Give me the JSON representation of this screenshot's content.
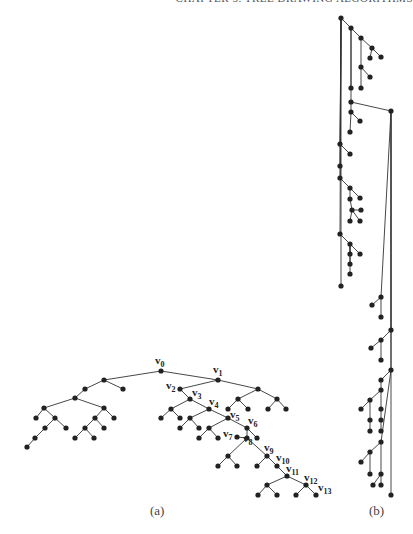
{
  "header": {
    "running_title": "CHAPTER 5.  TREE DRAWING ALGORITHMS"
  },
  "figure": {
    "captions": {
      "a": "(a)",
      "b": "(b)"
    },
    "style": {
      "edge_color": "#333333",
      "node_color": "#222222",
      "node_radius": 2.6
    },
    "tree_a": {
      "nodes": [
        {
          "id": "v0",
          "x": 161,
          "y": 371,
          "label": "v",
          "sub": "0",
          "lx": 155,
          "ly": 364
        },
        {
          "id": "v1",
          "x": 218,
          "y": 380,
          "label": "v",
          "sub": "1",
          "lx": 213,
          "ly": 373
        },
        {
          "id": "L1",
          "x": 104,
          "y": 380
        },
        {
          "id": "L2",
          "x": 123,
          "y": 389
        },
        {
          "id": "L3",
          "x": 85,
          "y": 389
        },
        {
          "id": "L4",
          "x": 75,
          "y": 398
        },
        {
          "id": "L5",
          "x": 44,
          "y": 408
        },
        {
          "id": "L6",
          "x": 36,
          "y": 418
        },
        {
          "id": "L7",
          "x": 55,
          "y": 418
        },
        {
          "id": "L8",
          "x": 45,
          "y": 428
        },
        {
          "id": "L9",
          "x": 66,
          "y": 428
        },
        {
          "id": "L10",
          "x": 35,
          "y": 438
        },
        {
          "id": "L11",
          "x": 27,
          "y": 447
        },
        {
          "id": "L12",
          "x": 104,
          "y": 408
        },
        {
          "id": "L13",
          "x": 114,
          "y": 418
        },
        {
          "id": "L14",
          "x": 95,
          "y": 418
        },
        {
          "id": "L15",
          "x": 85,
          "y": 428
        },
        {
          "id": "L16",
          "x": 104,
          "y": 428
        },
        {
          "id": "L17",
          "x": 75,
          "y": 438
        },
        {
          "id": "L18",
          "x": 94,
          "y": 438
        },
        {
          "id": "v2",
          "x": 180,
          "y": 389,
          "label": "v",
          "sub": "2",
          "lx": 166,
          "ly": 389
        },
        {
          "id": "R1",
          "x": 258,
          "y": 389
        },
        {
          "id": "R2",
          "x": 238,
          "y": 399
        },
        {
          "id": "R3",
          "x": 277,
          "y": 399
        },
        {
          "id": "R4",
          "x": 228,
          "y": 409
        },
        {
          "id": "R5",
          "x": 248,
          "y": 409
        },
        {
          "id": "R6",
          "x": 268,
          "y": 409
        },
        {
          "id": "R7",
          "x": 286,
          "y": 409
        },
        {
          "id": "v3",
          "x": 190,
          "y": 399,
          "label": "v",
          "sub": "3",
          "lx": 192,
          "ly": 396
        },
        {
          "id": "A1",
          "x": 171,
          "y": 409
        },
        {
          "id": "A2",
          "x": 161,
          "y": 418
        },
        {
          "id": "A3",
          "x": 180,
          "y": 418
        },
        {
          "id": "v4",
          "x": 209,
          "y": 409,
          "label": "v",
          "sub": "4",
          "lx": 209,
          "ly": 405
        },
        {
          "id": "B1",
          "x": 190,
          "y": 418
        },
        {
          "id": "B2",
          "x": 180,
          "y": 428
        },
        {
          "id": "B3",
          "x": 199,
          "y": 428
        },
        {
          "id": "v5",
          "x": 228,
          "y": 418,
          "label": "v",
          "sub": "5",
          "lx": 230,
          "ly": 418
        },
        {
          "id": "C1",
          "x": 209,
          "y": 428
        },
        {
          "id": "C2",
          "x": 199,
          "y": 438
        },
        {
          "id": "C3",
          "x": 218,
          "y": 438
        },
        {
          "id": "v6",
          "x": 247,
          "y": 428,
          "label": "v",
          "sub": "6",
          "lx": 248,
          "ly": 424
        },
        {
          "id": "D1",
          "x": 257,
          "y": 438
        },
        {
          "id": "v8",
          "x": 247,
          "y": 438,
          "label": "v",
          "sub": "8",
          "lx": 243,
          "ly": 442
        },
        {
          "id": "v7",
          "x": 237,
          "y": 437,
          "label": "v",
          "sub": "7",
          "lx": 223,
          "ly": 437
        },
        {
          "id": "E1",
          "x": 228,
          "y": 456
        },
        {
          "id": "E2",
          "x": 218,
          "y": 466
        },
        {
          "id": "E3",
          "x": 237,
          "y": 466
        },
        {
          "id": "v9",
          "x": 267,
          "y": 456,
          "label": "v",
          "sub": "9",
          "lx": 264,
          "ly": 451
        },
        {
          "id": "F1",
          "x": 257,
          "y": 466
        },
        {
          "id": "v10",
          "x": 277,
          "y": 466,
          "label": "v",
          "sub": "10",
          "lx": 276,
          "ly": 461
        },
        {
          "id": "v11",
          "x": 287,
          "y": 476,
          "label": "v",
          "sub": "11",
          "lx": 286,
          "ly": 472
        },
        {
          "id": "G1",
          "x": 267,
          "y": 485
        },
        {
          "id": "G2",
          "x": 258,
          "y": 495
        },
        {
          "id": "G3",
          "x": 277,
          "y": 495
        },
        {
          "id": "v12",
          "x": 306,
          "y": 485,
          "label": "v",
          "sub": "12",
          "lx": 304,
          "ly": 481
        },
        {
          "id": "H1",
          "x": 296,
          "y": 495
        },
        {
          "id": "v13",
          "x": 316,
          "y": 495,
          "label": "v",
          "sub": "13",
          "lx": 318,
          "ly": 491
        }
      ],
      "edges": [
        [
          "v0",
          "v1"
        ],
        [
          "v0",
          "L1"
        ],
        [
          "L1",
          "L2"
        ],
        [
          "L1",
          "L3"
        ],
        [
          "L3",
          "L4"
        ],
        [
          "L4",
          "L5"
        ],
        [
          "L4",
          "L12"
        ],
        [
          "L5",
          "L6"
        ],
        [
          "L5",
          "L7"
        ],
        [
          "L7",
          "L8"
        ],
        [
          "L7",
          "L9"
        ],
        [
          "L8",
          "L10"
        ],
        [
          "L10",
          "L11"
        ],
        [
          "L12",
          "L13"
        ],
        [
          "L12",
          "L14"
        ],
        [
          "L14",
          "L15"
        ],
        [
          "L14",
          "L16"
        ],
        [
          "L15",
          "L17"
        ],
        [
          "L15",
          "L18"
        ],
        [
          "v1",
          "v2"
        ],
        [
          "v1",
          "R1"
        ],
        [
          "R1",
          "R2"
        ],
        [
          "R1",
          "R3"
        ],
        [
          "R2",
          "R4"
        ],
        [
          "R2",
          "R5"
        ],
        [
          "R3",
          "R6"
        ],
        [
          "R3",
          "R7"
        ],
        [
          "v2",
          "v3"
        ],
        [
          "v3",
          "A1"
        ],
        [
          "A1",
          "A2"
        ],
        [
          "A1",
          "A3"
        ],
        [
          "v3",
          "v4"
        ],
        [
          "v4",
          "B1"
        ],
        [
          "B1",
          "B2"
        ],
        [
          "B1",
          "B3"
        ],
        [
          "v4",
          "v5"
        ],
        [
          "v5",
          "C1"
        ],
        [
          "C1",
          "C2"
        ],
        [
          "C1",
          "C3"
        ],
        [
          "v5",
          "v6"
        ],
        [
          "v6",
          "D1"
        ],
        [
          "v6",
          "v8"
        ],
        [
          "v8",
          "v7"
        ],
        [
          "v8",
          "E1"
        ],
        [
          "E1",
          "E2"
        ],
        [
          "E1",
          "E3"
        ],
        [
          "v8",
          "v9"
        ],
        [
          "v9",
          "F1"
        ],
        [
          "v9",
          "v10"
        ],
        [
          "v10",
          "v11"
        ],
        [
          "v11",
          "G1"
        ],
        [
          "G1",
          "G2"
        ],
        [
          "G1",
          "G3"
        ],
        [
          "v11",
          "v12"
        ],
        [
          "v12",
          "H1"
        ],
        [
          "v12",
          "v13"
        ]
      ]
    },
    "tree_b": {
      "nodes": [
        {
          "id": "b0",
          "x": 341,
          "y": 18
        },
        {
          "id": "b1",
          "x": 351,
          "y": 28
        },
        {
          "id": "b2",
          "x": 361,
          "y": 38
        },
        {
          "id": "b3",
          "x": 372,
          "y": 48
        },
        {
          "id": "b4",
          "x": 370,
          "y": 58
        },
        {
          "id": "b5",
          "x": 381,
          "y": 57
        },
        {
          "id": "b6",
          "x": 361,
          "y": 67
        },
        {
          "id": "b7",
          "x": 370,
          "y": 77
        },
        {
          "id": "b8",
          "x": 361,
          "y": 88
        },
        {
          "id": "b9",
          "x": 351,
          "y": 88
        },
        {
          "id": "b10",
          "x": 351,
          "y": 102
        },
        {
          "id": "b11",
          "x": 391,
          "y": 111
        },
        {
          "id": "b12",
          "x": 351,
          "y": 112
        },
        {
          "id": "b13",
          "x": 360,
          "y": 121
        },
        {
          "id": "b14",
          "x": 350,
          "y": 132
        },
        {
          "id": "b15",
          "x": 340,
          "y": 144
        },
        {
          "id": "b16",
          "x": 350,
          "y": 154
        },
        {
          "id": "b17",
          "x": 340,
          "y": 166
        },
        {
          "id": "b18",
          "x": 340,
          "y": 178
        },
        {
          "id": "b19",
          "x": 350,
          "y": 188
        },
        {
          "id": "b20",
          "x": 360,
          "y": 198
        },
        {
          "id": "b21",
          "x": 350,
          "y": 199
        },
        {
          "id": "b22",
          "x": 352,
          "y": 210
        },
        {
          "id": "b23",
          "x": 361,
          "y": 210
        },
        {
          "id": "b24",
          "x": 360,
          "y": 221
        },
        {
          "id": "b25",
          "x": 350,
          "y": 221
        },
        {
          "id": "b26",
          "x": 340,
          "y": 234
        },
        {
          "id": "b27",
          "x": 350,
          "y": 244
        },
        {
          "id": "b28",
          "x": 360,
          "y": 254
        },
        {
          "id": "b29",
          "x": 350,
          "y": 254
        },
        {
          "id": "b30",
          "x": 350,
          "y": 264
        },
        {
          "id": "b31",
          "x": 350,
          "y": 274
        },
        {
          "id": "b32",
          "x": 341,
          "y": 286
        },
        {
          "id": "b33",
          "x": 381,
          "y": 297
        },
        {
          "id": "b34",
          "x": 372,
          "y": 305
        },
        {
          "id": "b35",
          "x": 381,
          "y": 317
        },
        {
          "id": "b36",
          "x": 391,
          "y": 330
        },
        {
          "id": "b37",
          "x": 381,
          "y": 340
        },
        {
          "id": "b38",
          "x": 371,
          "y": 348
        },
        {
          "id": "b39",
          "x": 381,
          "y": 360
        },
        {
          "id": "b40",
          "x": 391,
          "y": 370
        },
        {
          "id": "b41",
          "x": 381,
          "y": 380
        },
        {
          "id": "b42",
          "x": 381,
          "y": 390
        },
        {
          "id": "b43",
          "x": 370,
          "y": 400
        },
        {
          "id": "b44",
          "x": 361,
          "y": 409
        },
        {
          "id": "b45",
          "x": 381,
          "y": 409
        },
        {
          "id": "b46",
          "x": 370,
          "y": 420
        },
        {
          "id": "b47",
          "x": 381,
          "y": 420
        },
        {
          "id": "b48",
          "x": 370,
          "y": 431
        },
        {
          "id": "b49",
          "x": 381,
          "y": 431
        },
        {
          "id": "b50",
          "x": 381,
          "y": 442
        },
        {
          "id": "b51",
          "x": 370,
          "y": 452
        },
        {
          "id": "b52",
          "x": 361,
          "y": 462
        },
        {
          "id": "b53",
          "x": 370,
          "y": 474
        },
        {
          "id": "b54",
          "x": 381,
          "y": 474
        },
        {
          "id": "b55",
          "x": 373,
          "y": 485
        },
        {
          "id": "b56",
          "x": 381,
          "y": 485
        },
        {
          "id": "b57",
          "x": 391,
          "y": 495
        }
      ],
      "edges": [
        [
          "b0",
          "b1"
        ],
        [
          "b1",
          "b2"
        ],
        [
          "b2",
          "b3"
        ],
        [
          "b3",
          "b4"
        ],
        [
          "b3",
          "b5"
        ],
        [
          "b2",
          "b6"
        ],
        [
          "b6",
          "b7"
        ],
        [
          "b6",
          "b8"
        ],
        [
          "b1",
          "b9"
        ],
        [
          "b1",
          "b10"
        ],
        [
          "b10",
          "b11"
        ],
        [
          "b10",
          "b12"
        ],
        [
          "b12",
          "b13"
        ],
        [
          "b12",
          "b14"
        ],
        [
          "b0",
          "b15"
        ],
        [
          "b15",
          "b16"
        ],
        [
          "b0",
          "b17"
        ],
        [
          "b0",
          "b18"
        ],
        [
          "b18",
          "b19"
        ],
        [
          "b19",
          "b20"
        ],
        [
          "b19",
          "b21"
        ],
        [
          "b21",
          "b22"
        ],
        [
          "b22",
          "b23"
        ],
        [
          "b22",
          "b24"
        ],
        [
          "b22",
          "b25"
        ],
        [
          "b0",
          "b26"
        ],
        [
          "b26",
          "b27"
        ],
        [
          "b27",
          "b28"
        ],
        [
          "b27",
          "b29"
        ],
        [
          "b27",
          "b30"
        ],
        [
          "b27",
          "b31"
        ],
        [
          "b0",
          "b32"
        ],
        [
          "b11",
          "b33"
        ],
        [
          "b33",
          "b34"
        ],
        [
          "b33",
          "b35"
        ],
        [
          "b11",
          "b36"
        ],
        [
          "b36",
          "b37"
        ],
        [
          "b37",
          "b38"
        ],
        [
          "b37",
          "b39"
        ],
        [
          "b11",
          "b40"
        ],
        [
          "b40",
          "b41"
        ],
        [
          "b41",
          "b42"
        ],
        [
          "b42",
          "b43"
        ],
        [
          "b43",
          "b44"
        ],
        [
          "b43",
          "b46"
        ],
        [
          "b42",
          "b45"
        ],
        [
          "b45",
          "b47"
        ],
        [
          "b40",
          "b50"
        ],
        [
          "b50",
          "b51"
        ],
        [
          "b51",
          "b52"
        ],
        [
          "b51",
          "b53"
        ],
        [
          "b50",
          "b54"
        ],
        [
          "b54",
          "b55"
        ],
        [
          "b54",
          "b56"
        ],
        [
          "b11",
          "b57"
        ],
        [
          "b47",
          "b49"
        ],
        [
          "b46",
          "b48"
        ]
      ]
    }
  }
}
